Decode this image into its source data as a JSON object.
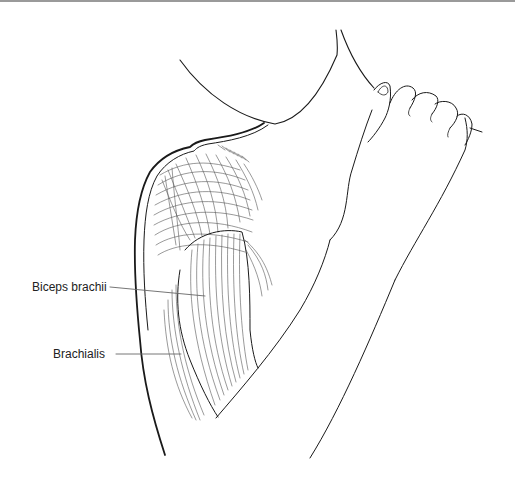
{
  "figure": {
    "labels": [
      {
        "text": "Biceps brachii",
        "target": "biceps"
      },
      {
        "text": "Brachialis",
        "target": "brachialis"
      }
    ]
  },
  "colors": {
    "outline": "#1a1a1a",
    "fiber": "#555555",
    "leader": "#666666",
    "label_text": "#222222",
    "background": "#ffffff"
  }
}
